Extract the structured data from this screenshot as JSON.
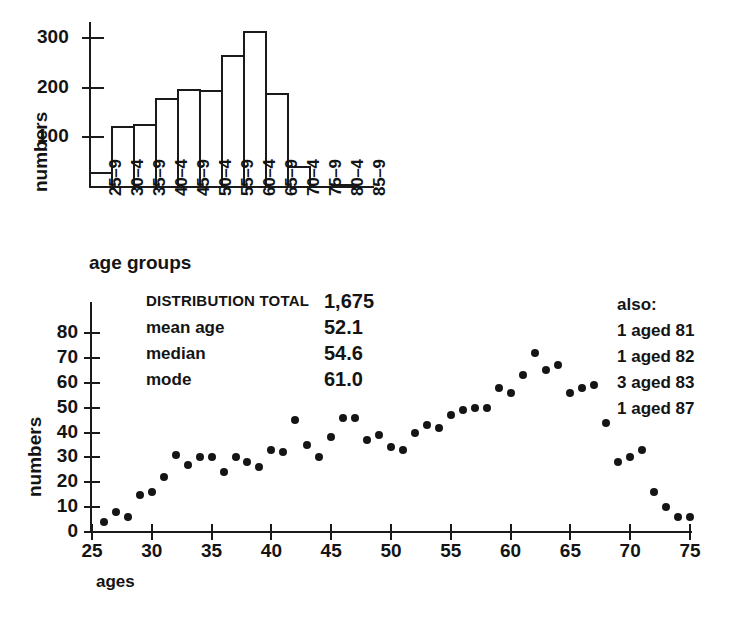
{
  "figure": {
    "background": "#ffffff",
    "ink": "#1a1a1a"
  },
  "histogram": {
    "ylabel": "numbers",
    "xlabel": "age groups",
    "y_ticks": [
      "100",
      "200",
      "300"
    ],
    "categories": [
      "25–9",
      "30–4",
      "35–9",
      "40–4",
      "45–9",
      "50–4",
      "55–9",
      "60–4",
      "65–9",
      "70–4",
      "75–9",
      "80–4",
      "85–9"
    ]
  },
  "scatter": {
    "ylabel": "numbers",
    "xlabel": "ages",
    "y_ticks": [
      "0",
      "10",
      "20",
      "30",
      "40",
      "50",
      "60",
      "70",
      "80"
    ],
    "x_ticks": [
      "25",
      "30",
      "35",
      "40",
      "45",
      "50",
      "55",
      "60",
      "65",
      "70",
      "75"
    ]
  },
  "stats": {
    "rows": [
      {
        "label": "DISTRIBUTION TOTAL",
        "value": "1,675",
        "caps": true
      },
      {
        "label": "mean age",
        "value": "52.1",
        "caps": false
      },
      {
        "label": "median",
        "value": "54.6",
        "caps": false
      },
      {
        "label": "mode",
        "value": "61.0",
        "caps": false
      }
    ]
  },
  "also": {
    "heading": "also:",
    "rows": [
      "1 aged 81",
      "1 aged 82",
      "3 aged 83",
      "1 aged 87"
    ]
  },
  "chart_data": [
    {
      "type": "bar",
      "title": "",
      "xlabel": "age groups",
      "ylabel": "numbers",
      "categories": [
        "25–9",
        "30–4",
        "35–9",
        "40–4",
        "45–9",
        "50–4",
        "55–9",
        "60–4",
        "65–9",
        "70–4",
        "75–9",
        "80–4",
        "85–9"
      ],
      "values": [
        30,
        122,
        127,
        180,
        197,
        195,
        267,
        315,
        190,
        42,
        0,
        6,
        0
      ],
      "ylim": [
        0,
        330
      ],
      "yticks": [
        100,
        200,
        300
      ],
      "grid": false,
      "legend": false
    },
    {
      "type": "scatter",
      "title": "",
      "xlabel": "ages",
      "ylabel": "numbers",
      "xlim": [
        25,
        75
      ],
      "ylim": [
        0,
        85
      ],
      "xticks": [
        25,
        30,
        35,
        40,
        45,
        50,
        55,
        60,
        65,
        70,
        75
      ],
      "yticks": [
        0,
        10,
        20,
        30,
        40,
        50,
        60,
        70,
        80
      ],
      "grid": false,
      "legend": false,
      "points": [
        {
          "x": 26,
          "y": 4
        },
        {
          "x": 27,
          "y": 8
        },
        {
          "x": 28,
          "y": 6
        },
        {
          "x": 29,
          "y": 15
        },
        {
          "x": 30,
          "y": 16
        },
        {
          "x": 31,
          "y": 22
        },
        {
          "x": 32,
          "y": 31
        },
        {
          "x": 33,
          "y": 27
        },
        {
          "x": 34,
          "y": 30
        },
        {
          "x": 35,
          "y": 30
        },
        {
          "x": 36,
          "y": 24
        },
        {
          "x": 37,
          "y": 30
        },
        {
          "x": 38,
          "y": 28
        },
        {
          "x": 39,
          "y": 26
        },
        {
          "x": 40,
          "y": 33
        },
        {
          "x": 41,
          "y": 32
        },
        {
          "x": 42,
          "y": 45
        },
        {
          "x": 43,
          "y": 35
        },
        {
          "x": 44,
          "y": 30
        },
        {
          "x": 45,
          "y": 38
        },
        {
          "x": 46,
          "y": 46
        },
        {
          "x": 47,
          "y": 46
        },
        {
          "x": 48,
          "y": 37
        },
        {
          "x": 49,
          "y": 39
        },
        {
          "x": 50,
          "y": 34
        },
        {
          "x": 51,
          "y": 33
        },
        {
          "x": 52,
          "y": 40
        },
        {
          "x": 53,
          "y": 43
        },
        {
          "x": 54,
          "y": 42
        },
        {
          "x": 55,
          "y": 47
        },
        {
          "x": 56,
          "y": 49
        },
        {
          "x": 57,
          "y": 50
        },
        {
          "x": 58,
          "y": 50
        },
        {
          "x": 59,
          "y": 58
        },
        {
          "x": 60,
          "y": 56
        },
        {
          "x": 61,
          "y": 63
        },
        {
          "x": 62,
          "y": 72
        },
        {
          "x": 63,
          "y": 65
        },
        {
          "x": 64,
          "y": 67
        },
        {
          "x": 65,
          "y": 56
        },
        {
          "x": 66,
          "y": 58
        },
        {
          "x": 67,
          "y": 59
        },
        {
          "x": 68,
          "y": 44
        },
        {
          "x": 69,
          "y": 28
        },
        {
          "x": 70,
          "y": 30
        },
        {
          "x": 71,
          "y": 33
        },
        {
          "x": 72,
          "y": 16
        },
        {
          "x": 73,
          "y": 10
        },
        {
          "x": 74,
          "y": 6
        },
        {
          "x": 75,
          "y": 6
        },
        {
          "x": 76,
          "y": 4
        }
      ]
    }
  ]
}
